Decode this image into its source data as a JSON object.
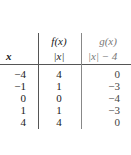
{
  "table": {
    "headers": {
      "x": "x",
      "f_name": "f(x)",
      "f_expr": "|x|",
      "g_name": "g(x)",
      "g_expr": "|x| − 4"
    },
    "rows": [
      {
        "x": "−4",
        "f": "4",
        "g": "0"
      },
      {
        "x": "−1",
        "f": "1",
        "g": "−3"
      },
      {
        "x": "0",
        "f": "0",
        "g": "−4"
      },
      {
        "x": "1",
        "f": "1",
        "g": "−3"
      },
      {
        "x": "4",
        "f": "4",
        "g": "0"
      }
    ]
  }
}
